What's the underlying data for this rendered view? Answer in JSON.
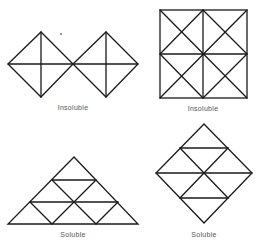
{
  "figures": [
    {
      "id": "two-diamonds",
      "label": "Insoluble",
      "label_pos": [
        73,
        104
      ]
    },
    {
      "id": "square-grid",
      "label": "Insoluble",
      "label_pos": [
        203,
        105
      ]
    },
    {
      "id": "triangle",
      "label": "Soluble",
      "label_pos": [
        73,
        231
      ]
    },
    {
      "id": "diamond",
      "label": "Soluble",
      "label_pos": [
        204,
        231
      ]
    }
  ],
  "colors": {
    "line": "#1a1a1a",
    "label": "#555555",
    "background": "#ffffff"
  }
}
